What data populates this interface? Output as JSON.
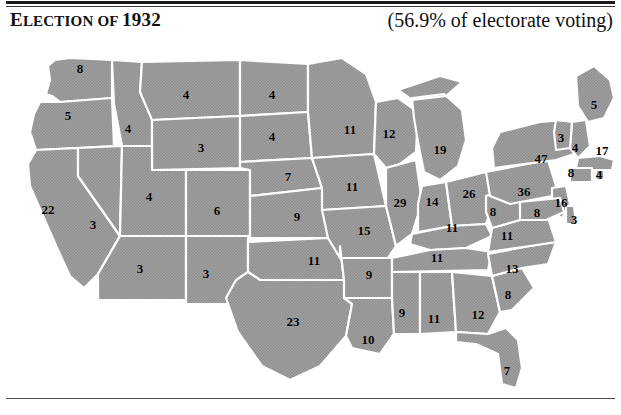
{
  "header": {
    "title_lead": "E",
    "title_small_caps": "LECTION OF ",
    "title_year": "1932",
    "title_full": "Election of 1932",
    "turnout": "(56.9% of electorate voting)"
  },
  "map": {
    "name": "united-states-electoral-map-1932",
    "fill_color": "#9a9a9a",
    "border_color": "#ffffff",
    "background_color": "#ffffff",
    "note": "All 48 contiguous states shaded uniformly (Democratic sweep); number on each state is its electoral vote count."
  },
  "chart_data": {
    "type": "map",
    "title": "Election of 1932",
    "subtitle": "(56.9% of electorate voting)",
    "unit": "electoral votes",
    "categories": [
      "WA",
      "OR",
      "CA",
      "NV",
      "ID",
      "MT",
      "WY",
      "UT",
      "AZ",
      "NM",
      "CO",
      "ND",
      "SD",
      "NE",
      "KS",
      "OK",
      "TX",
      "MN",
      "IA",
      "MO",
      "AR",
      "LA",
      "WI",
      "IL",
      "MI",
      "IN",
      "OH",
      "KY",
      "TN",
      "MS",
      "AL",
      "GA",
      "FL",
      "SC",
      "NC",
      "VA",
      "WV",
      "PA",
      "NY",
      "ME",
      "NH",
      "VT",
      "MA",
      "RI",
      "CT",
      "NJ",
      "DE",
      "MD"
    ],
    "values": [
      8,
      5,
      22,
      3,
      4,
      4,
      3,
      4,
      3,
      3,
      6,
      4,
      4,
      7,
      9,
      11,
      23,
      11,
      11,
      15,
      9,
      10,
      12,
      29,
      19,
      14,
      26,
      11,
      11,
      9,
      11,
      12,
      7,
      8,
      13,
      11,
      8,
      36,
      47,
      5,
      4,
      3,
      17,
      4,
      8,
      16,
      3,
      8
    ],
    "states": [
      {
        "code": "WA",
        "name": "Washington",
        "ev": 8,
        "x": 80,
        "y": 32
      },
      {
        "code": "OR",
        "name": "Oregon",
        "ev": 5,
        "x": 68,
        "y": 79
      },
      {
        "code": "CA",
        "name": "California",
        "ev": 22,
        "x": 48,
        "y": 173
      },
      {
        "code": "NV",
        "name": "Nevada",
        "ev": 3,
        "x": 93,
        "y": 188
      },
      {
        "code": "ID",
        "name": "Idaho",
        "ev": 4,
        "x": 128,
        "y": 92
      },
      {
        "code": "MT",
        "name": "Montana",
        "ev": 4,
        "x": 186,
        "y": 58
      },
      {
        "code": "WY",
        "name": "Wyoming",
        "ev": 3,
        "x": 201,
        "y": 111
      },
      {
        "code": "UT",
        "name": "Utah",
        "ev": 4,
        "x": 149,
        "y": 160
      },
      {
        "code": "AZ",
        "name": "Arizona",
        "ev": 3,
        "x": 140,
        "y": 232
      },
      {
        "code": "NM",
        "name": "New Mexico",
        "ev": 3,
        "x": 206,
        "y": 237
      },
      {
        "code": "CO",
        "name": "Colorado",
        "ev": 6,
        "x": 217,
        "y": 174
      },
      {
        "code": "ND",
        "name": "North Dakota",
        "ev": 4,
        "x": 272,
        "y": 58
      },
      {
        "code": "SD",
        "name": "South Dakota",
        "ev": 4,
        "x": 272,
        "y": 100
      },
      {
        "code": "NE",
        "name": "Nebraska",
        "ev": 7,
        "x": 288,
        "y": 140
      },
      {
        "code": "KS",
        "name": "Kansas",
        "ev": 9,
        "x": 297,
        "y": 180
      },
      {
        "code": "OK",
        "name": "Oklahoma",
        "ev": 11,
        "x": 314,
        "y": 224
      },
      {
        "code": "TX",
        "name": "Texas",
        "ev": 23,
        "x": 293,
        "y": 285
      },
      {
        "code": "MN",
        "name": "Minnesota",
        "ev": 11,
        "x": 350,
        "y": 93
      },
      {
        "code": "IA",
        "name": "Iowa",
        "ev": 11,
        "x": 352,
        "y": 150
      },
      {
        "code": "MO",
        "name": "Missouri",
        "ev": 15,
        "x": 364,
        "y": 194
      },
      {
        "code": "AR",
        "name": "Arkansas",
        "ev": 9,
        "x": 369,
        "y": 238
      },
      {
        "code": "LA",
        "name": "Louisiana",
        "ev": 10,
        "x": 368,
        "y": 303
      },
      {
        "code": "WI",
        "name": "Wisconsin",
        "ev": 12,
        "x": 389,
        "y": 97
      },
      {
        "code": "IL",
        "name": "Illinois",
        "ev": 29,
        "x": 400,
        "y": 166
      },
      {
        "code": "MI",
        "name": "Michigan",
        "ev": 19,
        "x": 440,
        "y": 113
      },
      {
        "code": "IN",
        "name": "Indiana",
        "ev": 14,
        "x": 432,
        "y": 165
      },
      {
        "code": "OH",
        "name": "Ohio",
        "ev": 26,
        "x": 469,
        "y": 157
      },
      {
        "code": "KY",
        "name": "Kentucky",
        "ev": 11,
        "x": 452,
        "y": 191
      },
      {
        "code": "TN",
        "name": "Tennessee",
        "ev": 11,
        "x": 437,
        "y": 221
      },
      {
        "code": "MS",
        "name": "Mississippi",
        "ev": 9,
        "x": 402,
        "y": 276
      },
      {
        "code": "AL",
        "name": "Alabama",
        "ev": 11,
        "x": 434,
        "y": 282
      },
      {
        "code": "GA",
        "name": "Georgia",
        "ev": 12,
        "x": 478,
        "y": 278
      },
      {
        "code": "FL",
        "name": "Florida",
        "ev": 7,
        "x": 507,
        "y": 334
      },
      {
        "code": "SC",
        "name": "South Carolina",
        "ev": 8,
        "x": 508,
        "y": 258
      },
      {
        "code": "NC",
        "name": "North Carolina",
        "ev": 13,
        "x": 512,
        "y": 232
      },
      {
        "code": "VA",
        "name": "Virginia",
        "ev": 11,
        "x": 507,
        "y": 199
      },
      {
        "code": "WV",
        "name": "West Virginia",
        "ev": 8,
        "x": 493,
        "y": 175
      },
      {
        "code": "PA",
        "name": "Pennsylvania",
        "ev": 36,
        "x": 524,
        "y": 155
      },
      {
        "code": "NY",
        "name": "New York",
        "ev": 47,
        "x": 541,
        "y": 122
      },
      {
        "code": "ME",
        "name": "Maine",
        "ev": 5,
        "x": 594,
        "y": 68
      },
      {
        "code": "NH",
        "name": "New Hampshire",
        "ev": 4,
        "x": 575,
        "y": 111
      },
      {
        "code": "VT",
        "name": "Vermont",
        "ev": 3,
        "x": 561,
        "y": 101
      },
      {
        "code": "MA",
        "name": "Massachusetts",
        "ev": 17,
        "x": 602,
        "y": 114
      },
      {
        "code": "RI",
        "name": "Rhode Island",
        "ev": 4,
        "x": 599,
        "y": 138
      },
      {
        "code": "CT",
        "name": "Connecticut",
        "ev": 8,
        "x": 571,
        "y": 136
      },
      {
        "code": "NJ",
        "name": "New Jersey",
        "ev": 16,
        "x": 561,
        "y": 166
      },
      {
        "code": "DE",
        "name": "Delaware",
        "ev": 3,
        "x": 574,
        "y": 183
      },
      {
        "code": "MD",
        "name": "Maryland",
        "ev": 8,
        "x": 537,
        "y": 176
      }
    ]
  }
}
